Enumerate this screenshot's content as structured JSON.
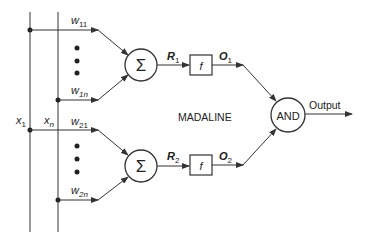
{
  "diagram": {
    "title": "MADALINE",
    "inputs": {
      "x1": "x",
      "x1_sub": "1",
      "xn": "x",
      "xn_sub": "n"
    },
    "weights": {
      "w11": {
        "base": "w",
        "sub": "11"
      },
      "w1n": {
        "base": "w",
        "sub": "1n"
      },
      "w21": {
        "base": "w",
        "sub": "21"
      },
      "w2n": {
        "base": "w",
        "sub": "2n"
      }
    },
    "summers": {
      "symbol": "Σ"
    },
    "responses": {
      "r1": {
        "base": "R",
        "sub": "1"
      },
      "r2": {
        "base": "R",
        "sub": "2"
      }
    },
    "activation": {
      "label": "f"
    },
    "outputs_units": {
      "o1": {
        "base": "O",
        "sub": "1"
      },
      "o2": {
        "base": "O",
        "sub": "2"
      }
    },
    "combiner": {
      "label": "AND"
    },
    "output_label": "Output",
    "colors": {
      "line": "#333333",
      "background": "#ffffff"
    }
  }
}
